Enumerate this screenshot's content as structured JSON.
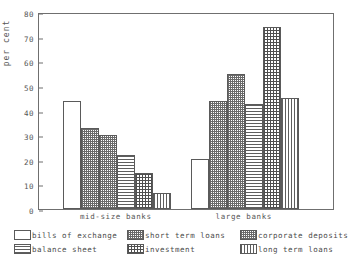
{
  "chart_data": {
    "type": "bar",
    "title": "",
    "xlabel": "",
    "ylabel": "per cent",
    "ylim": [
      0,
      80
    ],
    "yticks": [
      0,
      10,
      20,
      30,
      40,
      50,
      60,
      70,
      80
    ],
    "grid": false,
    "legend_position": "bottom",
    "categories": [
      "mid-size banks",
      "large banks"
    ],
    "series": [
      {
        "name": "bills of exchange",
        "pattern": "empty",
        "values": [
          44,
          20.5
        ]
      },
      {
        "name": "short term loans",
        "pattern": "dots",
        "values": [
          33,
          44
        ]
      },
      {
        "name": "corporate deposits",
        "pattern": "dots",
        "values": [
          30,
          55
        ]
      },
      {
        "name": "balance sheet",
        "pattern": "hlines",
        "values": [
          22,
          42.5
        ]
      },
      {
        "name": "investment",
        "pattern": "grid",
        "values": [
          14.5,
          74
        ]
      },
      {
        "name": "long term loans",
        "pattern": "vlines",
        "values": [
          6.5,
          45
        ]
      }
    ]
  },
  "axis": {
    "y_label": "per cent",
    "tick_0": "0",
    "tick_10": "10",
    "tick_20": "20",
    "tick_30": "30",
    "tick_40": "40",
    "tick_50": "50",
    "tick_60": "60",
    "tick_70": "70",
    "tick_80": "80"
  },
  "groups": {
    "group_1": "mid-size banks",
    "group_2": "large banks"
  },
  "legend": {
    "items": [
      {
        "label": "bills of exchange",
        "pattern": "empty"
      },
      {
        "label": "short term loans",
        "pattern": "dots"
      },
      {
        "label": "corporate deposits",
        "pattern": "dots"
      },
      {
        "label": "balance sheet",
        "pattern": "hlines"
      },
      {
        "label": "investment",
        "pattern": "grid"
      },
      {
        "label": "long term loans",
        "pattern": "vlines"
      }
    ]
  },
  "colors": {
    "frame": "#6f6f6f",
    "hatch": "#5e5e5e",
    "background": "#ffffff",
    "text": "#555555"
  }
}
